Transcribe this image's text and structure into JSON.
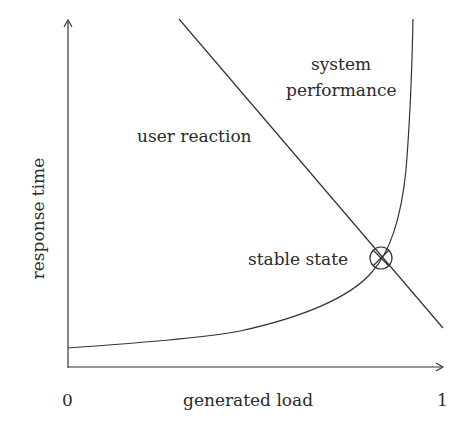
{
  "diagram": {
    "type": "line",
    "xlabel": "generated load",
    "ylabel": "response time",
    "x_ticks": [
      "0",
      "1"
    ],
    "curves": [
      {
        "name": "user reaction",
        "shape": "straight decreasing line"
      },
      {
        "name": "system performance",
        "shape": "increasing convex curve, asymptotic near load 1"
      }
    ],
    "annotations": {
      "user_reaction": "user reaction",
      "system_line1": "system",
      "system_line2": "performance",
      "stable_state": "stable state"
    },
    "marker": {
      "name": "stable state",
      "symbol": "circle-with-cross"
    }
  }
}
